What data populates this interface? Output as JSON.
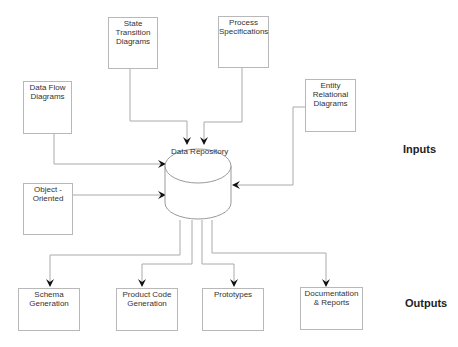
{
  "diagram": {
    "central": {
      "label": "Data Repository"
    },
    "inputs": [
      {
        "id": "state-transition",
        "label": "State Transition Diagrams"
      },
      {
        "id": "process-spec",
        "label": "Process Specifications"
      },
      {
        "id": "data-flow",
        "label": "Data Flow Diagrams"
      },
      {
        "id": "entity-relational",
        "label": "Entity Relational Diagrams"
      },
      {
        "id": "object-oriented",
        "label": "Object - Oriented"
      }
    ],
    "outputs": [
      {
        "id": "schema",
        "label": "Schema Generation"
      },
      {
        "id": "product-code",
        "label": "Product Code Generation"
      },
      {
        "id": "prototypes",
        "label": "Prototypes"
      },
      {
        "id": "documentation",
        "label": "Documentation & Reports"
      }
    ],
    "section_labels": {
      "inputs": "Inputs",
      "outputs": "Outputs"
    }
  }
}
